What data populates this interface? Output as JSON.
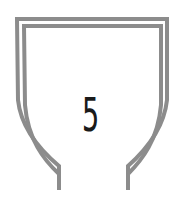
{
  "emblem": {
    "shape": "shield-outline",
    "numeral": "5",
    "colors": {
      "outline": "#8c8c8c",
      "numeral": "#1a1a1a",
      "background": "#ffffff"
    }
  }
}
